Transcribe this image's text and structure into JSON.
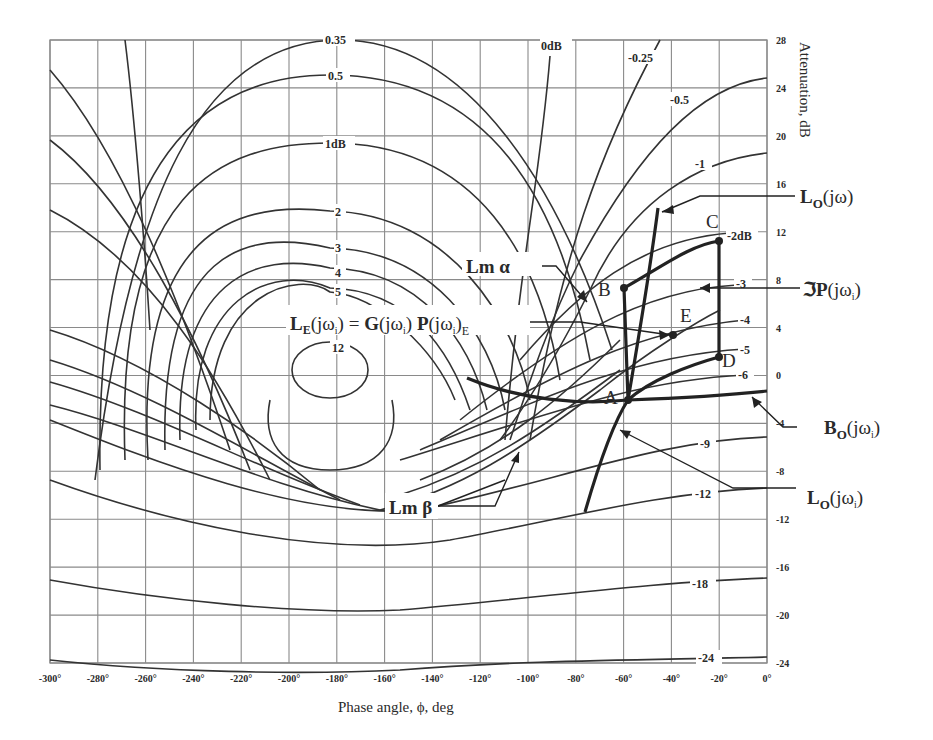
{
  "chart_data": {
    "type": "line",
    "xlabel": "Phase angle, ϕ, deg",
    "ylabel": "Attenuation, dB",
    "xlim": [
      -300,
      0
    ],
    "ylim": [
      -24,
      28
    ],
    "grid": true,
    "x_ticks": [
      -300,
      -280,
      -260,
      -240,
      -220,
      -200,
      -180,
      -160,
      -140,
      -120,
      -100,
      -80,
      -60,
      -40,
      -20,
      0
    ],
    "x_tick_labels": [
      "-300°",
      "-280°",
      "-260°",
      "-240°",
      "-220°",
      "-200°",
      "-180°",
      "-160°",
      "-140°",
      "-120°",
      "-100°",
      "-80°",
      "-60°",
      "-40°",
      "-20°",
      "0°"
    ],
    "y_ticks": [
      28,
      24,
      20,
      16,
      12,
      8,
      4,
      0,
      -4,
      -8,
      -12,
      -16,
      -20,
      -24
    ],
    "y_tick_labels": [
      "28",
      "24",
      "20",
      "16",
      "12",
      "8",
      "4",
      "0",
      "-4",
      "-8",
      "-12",
      "-16",
      "-20",
      "-24"
    ],
    "contour_labels": [
      "0.35",
      "0.5",
      "1dB",
      "2",
      "3",
      "4",
      "5",
      "12",
      "0dB",
      "-0.25",
      "-0.5",
      "-1",
      "-2dB",
      "-3",
      "-4",
      "-5",
      "-6",
      "-9",
      "-12",
      "-18",
      "-24"
    ],
    "points": [
      {
        "label": "A",
        "phase": -60,
        "db": -2
      },
      {
        "label": "B",
        "phase": -60,
        "db": 7.5
      },
      {
        "label": "C",
        "phase": -20,
        "db": 11.3
      },
      {
        "label": "D",
        "phase": -20,
        "db": 1.8
      },
      {
        "label": "E",
        "phase": -40,
        "db": 3.5
      }
    ],
    "series": [
      {
        "name": "L_O(jω)",
        "phase": [
          -77,
          -68,
          -60,
          -55,
          -50,
          -47
        ],
        "db": [
          -11,
          -6,
          -2,
          3,
          9,
          14
        ]
      },
      {
        "name": "B_O(jωi)",
        "phase": [
          -125,
          -100,
          -80,
          -60,
          -40,
          -20,
          0
        ],
        "db": [
          0,
          -1.5,
          -2.2,
          -2,
          -1.8,
          -1.6,
          -1
        ]
      },
      {
        "name": "Template ℑP(jωi)",
        "phase": [
          -60,
          -60,
          -40,
          -20,
          -20
        ],
        "db": [
          -2,
          7.5,
          10,
          11.3,
          1.8
        ]
      }
    ],
    "annotations": [
      "Lm α",
      "Lm β",
      "L_E(jωi) = G(jωi) P(jωi)_E",
      "L_O(jω)",
      "ℑP(jωi)",
      "B_O(jωi)",
      "L_O(jωi)"
    ]
  },
  "axis": {
    "x_title": "Phase angle, ϕ, deg",
    "y_title": "Attenuation, dB"
  },
  "labels": {
    "lm_alpha": "Lm α",
    "lm_beta": "Lm β",
    "le_eq_L": "L",
    "le_eq_E": "E",
    "le_eq_rest1": "(jω",
    "le_eq_i": "i",
    "le_eq_rest2": ") = ",
    "le_eq_G": "G",
    "le_eq_rest3": "(jω",
    "le_eq_rest4": ") ",
    "le_eq_P": "P",
    "le_eq_rest5": "(jω",
    "le_eq_rest6": ")",
    "lo_jw_L": "L",
    "lo_jw_O": "O",
    "lo_jw_rest": "(jω)",
    "template_sym": "ℑP",
    "template_rest": "(jω",
    "template_i": "i",
    "template_close": ")",
    "bo_B": "B",
    "bo_O": "O",
    "bo_rest": "(jω",
    "bo_i": "i",
    "bo_close": ")",
    "lo_i_L": "L",
    "lo_i_O": "O",
    "lo_i_rest": "(jω",
    "lo_i_i": "i",
    "lo_i_close": ")"
  },
  "colors": {
    "grid": "#8a8a8a",
    "curve": "#333333",
    "heavy": "#222222",
    "text": "#2a2a2a"
  }
}
